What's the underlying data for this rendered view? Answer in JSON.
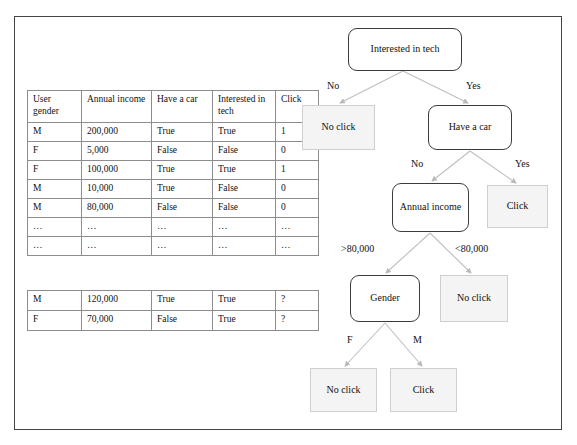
{
  "figure": {
    "title_visible": false
  },
  "main_table": {
    "columns": [
      "User gender",
      "Annual income",
      "Have a car",
      "Interested in tech",
      "Click"
    ],
    "rows": [
      [
        "M",
        "200,000",
        "True",
        "True",
        "1"
      ],
      [
        "F",
        "5,000",
        "False",
        "False",
        "0"
      ],
      [
        "F",
        "100,000",
        "True",
        "True",
        "1"
      ],
      [
        "M",
        "10,000",
        "True",
        "False",
        "0"
      ],
      [
        "M",
        "80,000",
        "False",
        "False",
        "0"
      ],
      [
        "…",
        "…",
        "…",
        "…",
        "…"
      ],
      [
        "…",
        "…",
        "…",
        "…",
        "…"
      ]
    ]
  },
  "query_table": {
    "rows": [
      [
        "M",
        "120,000",
        "True",
        "True",
        "?"
      ],
      [
        "F",
        "70,000",
        "False",
        "True",
        "?"
      ]
    ]
  },
  "tree": {
    "nodes": [
      {
        "id": "root",
        "label": "Interested in tech",
        "type": "decision"
      },
      {
        "id": "no-click-1",
        "label": "No click",
        "type": "leaf"
      },
      {
        "id": "have-a-car",
        "label": "Have a car",
        "type": "decision"
      },
      {
        "id": "click-1",
        "label": "Click",
        "type": "leaf"
      },
      {
        "id": "annual-income",
        "label": "Annual income",
        "type": "decision"
      },
      {
        "id": "gender",
        "label": "Gender",
        "type": "decision"
      },
      {
        "id": "no-click-2",
        "label": "No click",
        "type": "leaf"
      },
      {
        "id": "no-click-3",
        "label": "No click",
        "type": "leaf"
      },
      {
        "id": "click-2",
        "label": "Click",
        "type": "leaf"
      }
    ],
    "edge_labels": {
      "root_no": "No",
      "root_yes": "Yes",
      "car_no": "No",
      "car_yes": "Yes",
      "income_high": ">80,000",
      "income_low": "<80,000",
      "gender_f": "F",
      "gender_m": "M"
    }
  },
  "colors": {
    "frame": "#444444",
    "decision_border": "#3c3c3c",
    "leaf_fill": "#f4f4f4",
    "leaf_border": "#cfcfcf",
    "edge_line": "#b9b9b9",
    "table_border": "#8d8d8d"
  }
}
